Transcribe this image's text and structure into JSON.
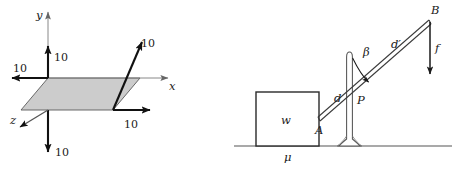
{
  "figures": [
    {
      "id": "coordinate-axes-parallelogram",
      "title": "",
      "axes": [
        {
          "name": "x",
          "label": "x"
        },
        {
          "name": "y",
          "label": "y"
        },
        {
          "name": "z",
          "label": "z"
        }
      ],
      "dimension_labels": [
        {
          "name": "y-up",
          "value": "10"
        },
        {
          "name": "x-negative",
          "value": "10"
        },
        {
          "name": "z-into-back",
          "value": "10"
        },
        {
          "name": "x-positive-bottom",
          "value": "10"
        },
        {
          "name": "y-down",
          "value": "10"
        }
      ],
      "shading": {
        "region": "parallelogram",
        "fill": "#cccccc",
        "stroke": "#555555"
      },
      "colors": {
        "axis": "#666666",
        "vector": "#111111",
        "shade": "#cccccc"
      }
    },
    {
      "id": "lever-block-fulcrum",
      "labels": {
        "block_weight": "w",
        "friction": "μ",
        "point_a": "A",
        "point_b": "B",
        "point_p": "P",
        "distance_d": "d",
        "distance_d_prime": "d′",
        "angle_beta": "β",
        "force_f": "f"
      },
      "colors": {
        "line": "#1a1a1a",
        "ground": "#444444",
        "bar": "#333333"
      }
    }
  ]
}
